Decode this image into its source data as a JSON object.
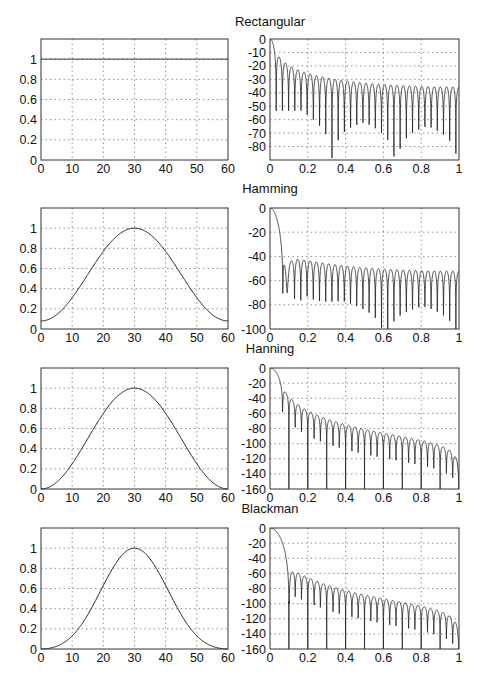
{
  "chart_data": [
    {
      "type": "line",
      "title": "Rectangular",
      "window": "rectangular",
      "time_plot": {
        "xlim": [
          0,
          60
        ],
        "ylim": [
          0,
          1.2
        ],
        "xticks": [
          0,
          10,
          20,
          30,
          40,
          50,
          60
        ],
        "yticks": [
          0,
          0.2,
          0.4,
          0.6,
          0.8,
          1
        ],
        "ytick_labels": [
          "0",
          "0.2",
          "0.4",
          "0.6",
          "0.8",
          "1"
        ],
        "grid": true,
        "description": "Constant value 1 for n = 0..60"
      },
      "freq_plot": {
        "xlim": [
          0,
          1
        ],
        "ylim": [
          -90,
          0
        ],
        "xticks": [
          0,
          0.2,
          0.4,
          0.6,
          0.8,
          1
        ],
        "xtick_labels": [
          "0",
          "0.2",
          "0.4",
          "0.6",
          "0.8",
          "1"
        ],
        "yticks": [
          0,
          -10,
          -20,
          -30,
          -40,
          -50,
          -60,
          -70,
          -80
        ],
        "ytick_labels": [
          "0",
          "-10",
          "-20",
          "-30",
          "-40",
          "-50",
          "-60",
          "-70",
          "-80"
        ],
        "grid": true,
        "ylabel": "dB",
        "description": "Magnitude response; first sidelobe about -13 dB, sidelobes decay to about -38 dB near 1"
      }
    },
    {
      "type": "line",
      "title": "Hamming",
      "window": "hamming",
      "time_plot": {
        "xlim": [
          0,
          60
        ],
        "ylim": [
          0,
          1.2
        ],
        "xticks": [
          0,
          10,
          20,
          30,
          40,
          50,
          60
        ],
        "yticks": [
          0,
          0.2,
          0.4,
          0.6,
          0.8,
          1
        ],
        "ytick_labels": [
          "0",
          "0.2",
          "0.4",
          "0.6",
          "0.8",
          "1"
        ],
        "grid": true,
        "description": "Raised cosine from 0.08 at ends to 1 at n=30"
      },
      "freq_plot": {
        "xlim": [
          0,
          1
        ],
        "ylim": [
          -100,
          0
        ],
        "xticks": [
          0,
          0.2,
          0.4,
          0.6,
          0.8,
          1
        ],
        "xtick_labels": [
          "0",
          "0.2",
          "0.4",
          "0.6",
          "0.8",
          "1"
        ],
        "yticks": [
          0,
          -20,
          -40,
          -60,
          -80,
          -100
        ],
        "ytick_labels": [
          "0",
          "-20",
          "-40",
          "-60",
          "-80",
          "-100"
        ],
        "grid": true,
        "description": "Magnitude response; sidelobes about -43 dB falling to about -55 dB"
      }
    },
    {
      "type": "line",
      "title": "Hanning",
      "window": "hanning",
      "time_plot": {
        "xlim": [
          0,
          60
        ],
        "ylim": [
          0,
          1.2
        ],
        "xticks": [
          0,
          10,
          20,
          30,
          40,
          50,
          60
        ],
        "yticks": [
          0,
          0.2,
          0.4,
          0.6,
          0.8,
          1
        ],
        "ytick_labels": [
          "0",
          "0.2",
          "0.4",
          "0.6",
          "0.8",
          "1"
        ],
        "grid": true,
        "description": "Raised cosine from 0 at ends to 1 at n=30"
      },
      "freq_plot": {
        "xlim": [
          0,
          1
        ],
        "ylim": [
          -160,
          0
        ],
        "xticks": [
          0,
          0.2,
          0.4,
          0.6,
          0.8,
          1
        ],
        "xtick_labels": [
          "0",
          "0.2",
          "0.4",
          "0.6",
          "0.8",
          "1"
        ],
        "yticks": [
          0,
          -20,
          -40,
          -60,
          -80,
          -100,
          -120,
          -140,
          -160
        ],
        "ytick_labels": [
          "0",
          "-20",
          "-40",
          "-60",
          "-80",
          "-100",
          "-120",
          "-140",
          "-160"
        ],
        "grid": true,
        "description": "Magnitude response; first sidelobe about -32 dB, sidelobes decay to about -125 dB near 1"
      }
    },
    {
      "type": "line",
      "title": "Blackman",
      "window": "blackman",
      "time_plot": {
        "xlim": [
          0,
          60
        ],
        "ylim": [
          0,
          1.2
        ],
        "xticks": [
          0,
          10,
          20,
          30,
          40,
          50,
          60
        ],
        "yticks": [
          0,
          0.2,
          0.4,
          0.6,
          0.8,
          1
        ],
        "ytick_labels": [
          "0",
          "0.2",
          "0.4",
          "0.6",
          "0.8",
          "1"
        ],
        "grid": true,
        "description": "Blackman window from 0 at ends to 1 at n=30"
      },
      "freq_plot": {
        "xlim": [
          0,
          1
        ],
        "ylim": [
          -160,
          0
        ],
        "xticks": [
          0,
          0.2,
          0.4,
          0.6,
          0.8,
          1
        ],
        "xtick_labels": [
          "0",
          "0.2",
          "0.4",
          "0.6",
          "0.8",
          "1"
        ],
        "yticks": [
          0,
          -20,
          -40,
          -60,
          -80,
          -100,
          -120,
          -140,
          -160
        ],
        "ytick_labels": [
          "0",
          "-20",
          "-40",
          "-60",
          "-80",
          "-100",
          "-120",
          "-140",
          "-160"
        ],
        "grid": true,
        "description": "Magnitude response; first sidelobe about -58 dB, sidelobes decay to about -130 dB near 1"
      }
    }
  ],
  "layout": {
    "rows_top": [
      39,
      208,
      368,
      528
    ],
    "row_height": 121,
    "left_box": [
      41,
      228
    ],
    "right_box": [
      270,
      459
    ],
    "title_y": [
      20,
      187,
      347,
      507
    ],
    "line_color": "#222222",
    "grid_color": "#777777"
  }
}
